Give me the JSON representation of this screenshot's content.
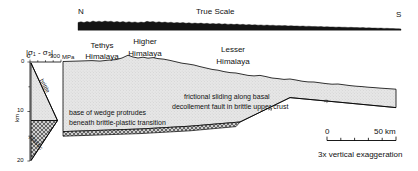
{
  "figure": {
    "type": "geologic-cross-section",
    "true_scale_profile": {
      "label": "True Scale",
      "left_direction": "N",
      "right_direction": "S"
    },
    "exaggerated_section": {
      "units": [
        {
          "name_line1": "Tethys",
          "name_line2": "Himalaya"
        },
        {
          "name_line1": "Higher",
          "name_line2": "Himalaya"
        },
        {
          "name_line1": "Lesser",
          "name_line2": "Himalaya"
        }
      ],
      "annotations": [
        {
          "line1": "frictional sliding along basal",
          "line2": "decollement fault in brittle upper crust"
        },
        {
          "line1": "base of wedge protrudes",
          "line2": "beneath brittle-plastic transition"
        }
      ]
    },
    "strength_plot": {
      "axis_title": "|σ₁ - σ₃|",
      "x_ticks": [
        "0",
        "300"
      ],
      "x_unit": "MPa",
      "y_label": "km",
      "y_ticks": [
        "0",
        "10",
        "20"
      ],
      "regime_brittle": "brittle",
      "regime_plastic": "plastic"
    },
    "scale_bar": {
      "start": "0",
      "end": "50 km",
      "note": "3x vertical exaggeration"
    },
    "colors": {
      "wedge_fill": "#e3e3e3",
      "line": "#000000",
      "profile_fill": "#1a1a1a",
      "hatch": "#4d4d4d"
    }
  }
}
